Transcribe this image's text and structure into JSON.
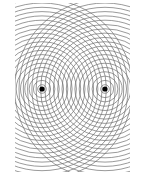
{
  "diagram": {
    "width": 143,
    "height": 190,
    "background": "#ffffff",
    "clip": {
      "x": 15,
      "y": 3,
      "width": 115,
      "height": 169
    },
    "ring_color": "#6e6e6e",
    "ring_stroke_width": 0.7,
    "ring_spacing": 4.3,
    "ring_count": 21,
    "sources": [
      {
        "name": "left-source",
        "cx": 42,
        "cy": 89,
        "r": 2.6,
        "color": "#000000"
      },
      {
        "name": "right-source",
        "cx": 105,
        "cy": 89,
        "r": 2.6,
        "color": "#000000"
      }
    ]
  }
}
